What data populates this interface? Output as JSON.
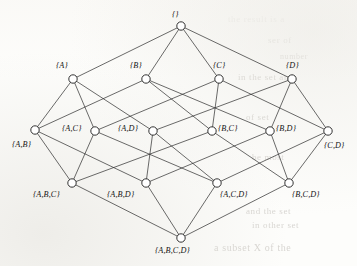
{
  "figure": {
    "kind": "hasse-diagram",
    "width": 357,
    "height": 266,
    "ink_color": "#1d1d1d",
    "paper_color": "#fdfdfb"
  },
  "nodes": [
    {
      "id": "empty",
      "label": "{}",
      "x": 181,
      "y": 26,
      "r": 4.2,
      "label_x": 172,
      "label_y": 10,
      "rank": 0
    },
    {
      "id": "A",
      "label": "{A}",
      "x": 73,
      "y": 79,
      "r": 4.2,
      "label_x": 56,
      "label_y": 61,
      "rank": 1
    },
    {
      "id": "B",
      "label": "{B}",
      "x": 146,
      "y": 79,
      "r": 4.2,
      "label_x": 130,
      "label_y": 61,
      "rank": 1
    },
    {
      "id": "C",
      "label": "{C}",
      "x": 219,
      "y": 79,
      "r": 4.2,
      "label_x": 213,
      "label_y": 61,
      "rank": 1
    },
    {
      "id": "D",
      "label": "{D}",
      "x": 292,
      "y": 79,
      "r": 4.2,
      "label_x": 286,
      "label_y": 61,
      "rank": 1
    },
    {
      "id": "AB",
      "label": "{A,B}",
      "x": 35,
      "y": 130,
      "r": 4.2,
      "label_x": 12,
      "label_y": 140,
      "rank": 2
    },
    {
      "id": "AC",
      "label": "{A,C}",
      "x": 95,
      "y": 131,
      "r": 4.2,
      "label_x": 62,
      "label_y": 124,
      "rank": 2
    },
    {
      "id": "AD",
      "label": "{A,D}",
      "x": 153,
      "y": 131,
      "r": 4.2,
      "label_x": 118,
      "label_y": 124,
      "rank": 2
    },
    {
      "id": "BC",
      "label": "{B,C}",
      "x": 212,
      "y": 131,
      "r": 4.2,
      "label_x": 218,
      "label_y": 124,
      "rank": 2
    },
    {
      "id": "BD",
      "label": "{B,D}",
      "x": 270,
      "y": 131,
      "r": 4.2,
      "label_x": 276,
      "label_y": 124,
      "rank": 2
    },
    {
      "id": "CD",
      "label": "{C,D}",
      "x": 328,
      "y": 131,
      "r": 4.2,
      "label_x": 324,
      "label_y": 141,
      "rank": 2
    },
    {
      "id": "ABC",
      "label": "{A,B,C}",
      "x": 72,
      "y": 183,
      "r": 4.2,
      "label_x": 33,
      "label_y": 190,
      "rank": 3
    },
    {
      "id": "ABD",
      "label": "{A,B,D}",
      "x": 146,
      "y": 183,
      "r": 4.2,
      "label_x": 107,
      "label_y": 190,
      "rank": 3
    },
    {
      "id": "ACD",
      "label": "{A,C,D}",
      "x": 217,
      "y": 183,
      "r": 4.2,
      "label_x": 220,
      "label_y": 190,
      "rank": 3
    },
    {
      "id": "BCD",
      "label": "{B,C,D}",
      "x": 289,
      "y": 183,
      "r": 4.2,
      "label_x": 292,
      "label_y": 190,
      "rank": 3
    },
    {
      "id": "ABCD",
      "label": "{A,B,C,D}",
      "x": 181,
      "y": 238,
      "r": 4.2,
      "label_x": 155,
      "label_y": 246,
      "rank": 4
    }
  ],
  "edges": [
    {
      "from": "empty",
      "to": "A"
    },
    {
      "from": "empty",
      "to": "B"
    },
    {
      "from": "empty",
      "to": "C"
    },
    {
      "from": "empty",
      "to": "D"
    },
    {
      "from": "A",
      "to": "AB"
    },
    {
      "from": "A",
      "to": "AC"
    },
    {
      "from": "A",
      "to": "AD"
    },
    {
      "from": "B",
      "to": "AB"
    },
    {
      "from": "B",
      "to": "BC"
    },
    {
      "from": "B",
      "to": "BD"
    },
    {
      "from": "C",
      "to": "AC"
    },
    {
      "from": "C",
      "to": "BC"
    },
    {
      "from": "C",
      "to": "CD"
    },
    {
      "from": "D",
      "to": "AD"
    },
    {
      "from": "D",
      "to": "BD"
    },
    {
      "from": "D",
      "to": "CD"
    },
    {
      "from": "AB",
      "to": "ABC"
    },
    {
      "from": "AB",
      "to": "ABD"
    },
    {
      "from": "AC",
      "to": "ABC"
    },
    {
      "from": "AC",
      "to": "ACD"
    },
    {
      "from": "AD",
      "to": "ABD"
    },
    {
      "from": "AD",
      "to": "ACD"
    },
    {
      "from": "BC",
      "to": "ABC"
    },
    {
      "from": "BC",
      "to": "BCD"
    },
    {
      "from": "BD",
      "to": "ABD"
    },
    {
      "from": "BD",
      "to": "BCD"
    },
    {
      "from": "CD",
      "to": "ACD"
    },
    {
      "from": "CD",
      "to": "BCD"
    },
    {
      "from": "ABC",
      "to": "ABCD"
    },
    {
      "from": "ABD",
      "to": "ABCD"
    },
    {
      "from": "ACD",
      "to": "ABCD"
    },
    {
      "from": "BCD",
      "to": "ABCD"
    }
  ],
  "background_artifacts": [
    {
      "text": "the result is a",
      "x": 228,
      "y": 14,
      "size": 9,
      "rot": 0
    },
    {
      "text": "ser of",
      "x": 268,
      "y": 35,
      "size": 9,
      "rot": 0
    },
    {
      "text": "in  the  set  and",
      "x": 238,
      "y": 72,
      "size": 9,
      "rot": 0
    },
    {
      "text": "of  set",
      "x": 246,
      "y": 112,
      "size": 9,
      "rot": 0
    },
    {
      "text": "be  most",
      "x": 252,
      "y": 152,
      "size": 9,
      "rot": 0
    },
    {
      "text": "and  the  set",
      "x": 246,
      "y": 206,
      "size": 9,
      "rot": 0
    },
    {
      "text": "a  subset  X  of  the",
      "x": 214,
      "y": 242,
      "size": 10,
      "rot": 0
    },
    {
      "text": "in  other  set",
      "x": 252,
      "y": 220,
      "size": 9,
      "rot": 0
    },
    {
      "text": "number",
      "x": 280,
      "y": 52,
      "size": 8,
      "rot": 0
    }
  ]
}
